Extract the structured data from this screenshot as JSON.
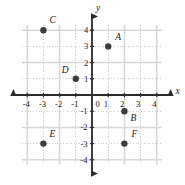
{
  "chart_data": {
    "type": "scatter",
    "title": "",
    "xlabel": "x",
    "ylabel": "y",
    "xlim": [
      -4.6,
      4.6
    ],
    "ylim": [
      -4.6,
      4.6
    ],
    "grid": true,
    "grid_style": "dotted",
    "legend": "none",
    "origin_label": "0",
    "xticks": [
      -4,
      -3,
      -2,
      -1,
      1,
      2,
      3,
      4
    ],
    "yticks": [
      4,
      3,
      2,
      1,
      -1,
      -2,
      -3,
      -4
    ],
    "xtick_labels": [
      "-4",
      "-3",
      "-2",
      "-1",
      "1",
      "2",
      "3",
      "4"
    ],
    "ytick_labels": [
      "4",
      "3",
      "2",
      "1",
      "-1",
      "-2",
      "-3",
      "-4"
    ],
    "points": [
      {
        "name": "A",
        "x": 1,
        "y": 3,
        "label_dx": 7,
        "label_dy": -13
      },
      {
        "name": "B",
        "x": 2,
        "y": -1,
        "label_dx": 6,
        "label_dy": 3
      },
      {
        "name": "C",
        "x": -3,
        "y": 4,
        "label_dx": 6,
        "label_dy": -14
      },
      {
        "name": "D",
        "x": -1,
        "y": 1,
        "label_dx": -14,
        "label_dy": -13
      },
      {
        "name": "E",
        "x": -3,
        "y": -3,
        "label_dx": 6,
        "label_dy": -14
      },
      {
        "name": "F",
        "x": 2,
        "y": -3,
        "label_dx": 7,
        "label_dy": -14
      }
    ],
    "colors": {
      "point": "#3c3c3c",
      "axis": "#2a2a2a",
      "grid": "#c9c9c9",
      "text": "#1a1a1a",
      "background": "#fefefe"
    }
  },
  "geometry": {
    "origin_x": 92,
    "origin_y": 95,
    "unit": 16.2,
    "point_radius": 3.2,
    "axis_extent": 4.85,
    "grid_extent": 4.3
  }
}
